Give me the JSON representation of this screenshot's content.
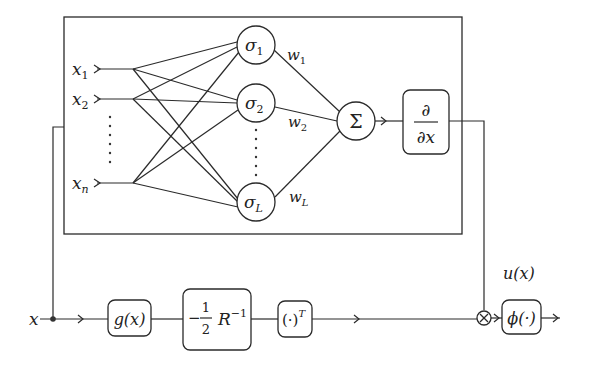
{
  "diagram": {
    "title": "",
    "type": "neural-network-controller-block-diagram",
    "inputs": [
      {
        "id": "x1",
        "base": "x",
        "sub": "1"
      },
      {
        "id": "x2",
        "base": "x",
        "sub": "2"
      },
      {
        "id": "xn",
        "base": "x",
        "sub": "n"
      }
    ],
    "hidden_nodes": [
      {
        "id": "sigma1",
        "base": "σ",
        "sub": "1"
      },
      {
        "id": "sigma2",
        "base": "σ",
        "sub": "2"
      },
      {
        "id": "sigmaL",
        "base": "σ",
        "sub": "L"
      }
    ],
    "weights": [
      {
        "id": "w1",
        "base": "w",
        "sub": "1"
      },
      {
        "id": "w2",
        "base": "w",
        "sub": "2"
      },
      {
        "id": "wL",
        "base": "w",
        "sub": "L"
      }
    ],
    "sum_node": {
      "symbol": "Σ"
    },
    "derivative_block": {
      "numerator": "∂",
      "denominator": "∂x"
    },
    "state_input": {
      "label": "x"
    },
    "g_block": {
      "label": "g(x)"
    },
    "r_block": {
      "sign": "−",
      "frac_num": "1",
      "frac_den": "2",
      "matrix": "R",
      "exponent": "−1"
    },
    "transpose_block": {
      "label": "(·)",
      "exponent": "T"
    },
    "multiply_node": {
      "symbol": "×"
    },
    "phi_block": {
      "label": "ϕ(·)"
    },
    "output": {
      "label": "u(x)"
    },
    "edges": [
      "x → split → g(x)",
      "x → feedback → NN inputs x1..xn",
      "x_i → σ_j (fully connected)",
      "σ_j --w_j--> Σ",
      "Σ → ∂/∂x",
      "∂/∂x → ×",
      "g(x) → −½R⁻¹ → (·)ᵀ → ×",
      "× → ϕ(·) → u(x)"
    ]
  }
}
